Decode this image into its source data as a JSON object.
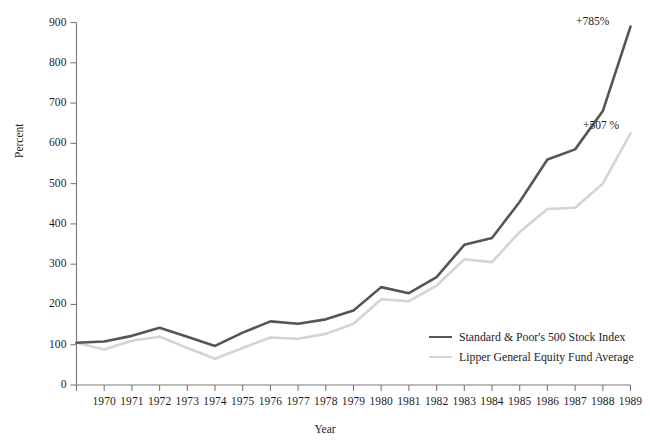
{
  "chart_data": {
    "type": "line",
    "title": "",
    "xlabel": "Year",
    "ylabel": "Percent",
    "xlim": [
      1969,
      1989
    ],
    "ylim": [
      0,
      900
    ],
    "ytick_step": 100,
    "grid": false,
    "legend_position": "inside-bottom-right",
    "x": [
      1969,
      1970,
      1971,
      1972,
      1973,
      1974,
      1975,
      1976,
      1977,
      1978,
      1979,
      1980,
      1981,
      1982,
      1983,
      1984,
      1985,
      1986,
      1987,
      1988,
      1989
    ],
    "xtick_labels": [
      "1970",
      "1971",
      "1972",
      "1973",
      "1974",
      "1975",
      "1976",
      "1977",
      "1978",
      "1979",
      "1980",
      "1981",
      "1982",
      "1983",
      "1984",
      "1985",
      "1986",
      "1987",
      "1988",
      "1989"
    ],
    "ytick_labels": [
      "0",
      "100",
      "200",
      "300",
      "400",
      "500",
      "600",
      "700",
      "800",
      "900"
    ],
    "ytick_values": [
      0,
      100,
      200,
      300,
      400,
      500,
      600,
      700,
      800,
      900
    ],
    "series": [
      {
        "name": "Standard & Poor's 500 Stock Index",
        "color": "#555555",
        "width": 2.6,
        "values": [
          105,
          108,
          122,
          142,
          120,
          97,
          130,
          158,
          152,
          163,
          185,
          243,
          228,
          268,
          348,
          365,
          455,
          560,
          585,
          680,
          890
        ]
      },
      {
        "name": "Lipper General Equity Fund Average",
        "color": "#d4d4d4",
        "width": 2.6,
        "values": [
          105,
          88,
          110,
          120,
          92,
          65,
          92,
          118,
          115,
          127,
          152,
          213,
          208,
          247,
          312,
          305,
          380,
          437,
          440,
          500,
          625
        ]
      }
    ],
    "annotations": [
      {
        "text": "+785%",
        "series": "Standard & Poor's 500 Stock Index",
        "x": 1989,
        "y": 890
      },
      {
        "text": "+507 %",
        "series": "Lipper General Equity Fund Average",
        "x": 1989,
        "y": 625
      }
    ],
    "legend": [
      {
        "label": "Standard & Poor's 500 Stock Index",
        "color": "#555555"
      },
      {
        "label": "Lipper General Equity Fund Average",
        "color": "#d4d4d4"
      }
    ],
    "axis_color": "#7a7a7a"
  }
}
